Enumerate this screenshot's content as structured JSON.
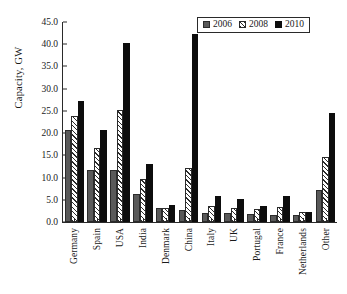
{
  "chart_data": {
    "type": "bar",
    "title": "",
    "subtitle": "",
    "xlabel": "",
    "ylabel": "Capacity, GW",
    "ylim": [
      0,
      45
    ],
    "ytick_step": 5,
    "ytick_labels": [
      "0.0",
      "5.0",
      "10.0",
      "15.0",
      "20.0",
      "25.0",
      "30.0",
      "35.0",
      "40.0",
      "45.0"
    ],
    "ytick_values": [
      0,
      5,
      10,
      15,
      20,
      25,
      30,
      35,
      40,
      45
    ],
    "grid": false,
    "legend_position": "top-right",
    "categories": [
      "Germany",
      "Spain",
      "USA",
      "India",
      "Denmark",
      "China",
      "Italy",
      "UK",
      "Portugal",
      "France",
      "Netherlands",
      "Other"
    ],
    "series": [
      {
        "name": "2006",
        "color": "#595959",
        "pattern": "solid-gray",
        "values": [
          20.6,
          11.6,
          11.6,
          6.3,
          3.1,
          2.6,
          2.1,
          2.0,
          1.7,
          1.6,
          1.6,
          7.3
        ]
      },
      {
        "name": "2008",
        "color": "#ffffff",
        "pattern": "diagonal-hatch",
        "values": [
          23.9,
          16.7,
          25.2,
          9.7,
          3.2,
          12.2,
          3.7,
          3.2,
          3.0,
          3.4,
          2.2,
          14.6
        ]
      },
      {
        "name": "2010",
        "color": "#0d0d0d",
        "pattern": "solid-black",
        "values": [
          27.2,
          20.7,
          40.2,
          13.1,
          3.8,
          42.3,
          5.8,
          5.2,
          3.7,
          5.8,
          2.3,
          24.5
        ]
      }
    ]
  }
}
